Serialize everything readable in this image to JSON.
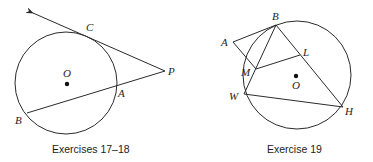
{
  "figures": [
    {
      "id": "fig1",
      "caption": "Exercises 17–18",
      "circle": {
        "cx": 66,
        "cy": 83,
        "r": 51
      },
      "center": {
        "label": "O",
        "x": 67,
        "y": 84
      },
      "points": {
        "C": {
          "label": "C",
          "x": 86,
          "y": 33
        },
        "P": {
          "label": "P",
          "x": 165,
          "y": 71
        },
        "A": {
          "label": "A",
          "x": 117,
          "y": 86
        },
        "B": {
          "label": "B",
          "x": 27,
          "y": 113
        }
      },
      "segments": [
        {
          "from": "P",
          "to": "arrow_tip",
          "type": "ray",
          "note": "tangent ray through C"
        },
        {
          "from": "P",
          "to": "B",
          "type": "secant",
          "note": "secant through A"
        }
      ]
    },
    {
      "id": "fig2",
      "caption": "Exercise 19",
      "circle": {
        "cx": 297,
        "cy": 75,
        "r": 54
      },
      "center": {
        "label": "O",
        "x": 296,
        "y": 76
      },
      "points": {
        "A": {
          "label": "A",
          "x": 233,
          "y": 42
        },
        "B": {
          "label": "B",
          "x": 276,
          "y": 25
        },
        "L": {
          "label": "L",
          "x": 300,
          "y": 55
        },
        "M": {
          "label": "M",
          "x": 256,
          "y": 69
        },
        "W": {
          "label": "W",
          "x": 244,
          "y": 94
        },
        "H": {
          "label": "H",
          "x": 343,
          "y": 107
        }
      },
      "segments": [
        [
          "A",
          "B"
        ],
        [
          "A",
          "M"
        ],
        [
          "B",
          "W"
        ],
        [
          "B",
          "H"
        ],
        [
          "M",
          "L"
        ],
        [
          "W",
          "H"
        ]
      ]
    }
  ],
  "labels": {
    "fig1": {
      "C": "C",
      "O": "O",
      "P": "P",
      "A": "A",
      "B": "B"
    },
    "fig2": {
      "A": "A",
      "B": "B",
      "L": "L",
      "M": "M",
      "O": "O",
      "W": "W",
      "H": "H"
    },
    "caption1": "Exercises 17–18",
    "caption2": "Exercise 19"
  }
}
